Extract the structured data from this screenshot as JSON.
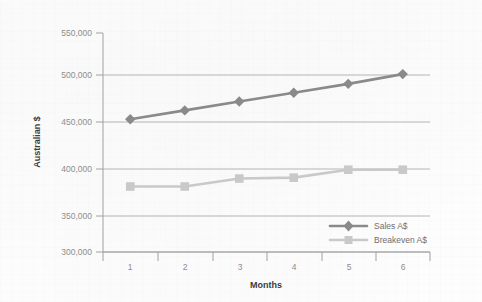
{
  "chart_data": {
    "type": "line",
    "title": "",
    "subtitle": "",
    "xlabel": "Months",
    "ylabel": "Australian $",
    "categories": [
      "1",
      "2",
      "3",
      "4",
      "5",
      "6"
    ],
    "ylim": [
      300000,
      550000
    ],
    "y_ticks": [
      300000,
      350000,
      400000,
      450000,
      500000,
      550000
    ],
    "y_tick_labels": [
      "300,000",
      "350,000",
      "400,000",
      "450,000",
      "500,000",
      "550,000"
    ],
    "grid": true,
    "grid_axis": "y",
    "legend_position": "lower right (inside plot)",
    "series": [
      {
        "name": "Sales A$",
        "color": "#8a8a8a",
        "marker": "diamond",
        "values": [
          450000,
          460000,
          470000,
          480000,
          490000,
          501000
        ]
      },
      {
        "name": "Breakeven A$",
        "color": "#c9c9c9",
        "marker": "square",
        "values": [
          374000,
          374000,
          383000,
          384000,
          393000,
          393000
        ]
      }
    ]
  },
  "axes": {
    "y_title": "Australian $",
    "x_title": "Months"
  },
  "legend": {
    "entries": [
      {
        "label": "Sales A$"
      },
      {
        "label": "Breakeven A$"
      }
    ]
  },
  "colors": {
    "series_sales": "#8a8a8a",
    "series_breakeven": "#c9c9c9",
    "gridline": "#b4b4b4",
    "axis": "#a0a0a0",
    "tick_text": "#8d8d8d",
    "title_text": "#3c3c3c",
    "background": "#fdfdfd"
  }
}
